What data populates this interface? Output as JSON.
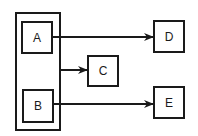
{
  "diagram": {
    "type": "block-diagram",
    "container": {
      "id": "group-AB",
      "contains": [
        "A",
        "B"
      ]
    },
    "nodes": [
      {
        "id": "A",
        "label": "A"
      },
      {
        "id": "B",
        "label": "B"
      },
      {
        "id": "C",
        "label": "C"
      },
      {
        "id": "D",
        "label": "D"
      },
      {
        "id": "E",
        "label": "E"
      }
    ],
    "edges": [
      {
        "from": "A",
        "to": "D"
      },
      {
        "from": "group-AB",
        "to": "C"
      },
      {
        "from": "B",
        "to": "E"
      }
    ],
    "colors": {
      "stroke": "#1a1a1a",
      "background": "#ffffff"
    }
  }
}
